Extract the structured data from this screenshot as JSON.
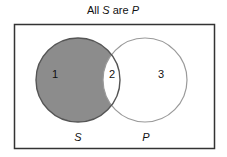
{
  "title": {
    "prefix": "All ",
    "term1": "S",
    "middle": " are ",
    "term2": "P"
  },
  "regions": [
    {
      "label": "1",
      "shaded": true
    },
    {
      "label": "2",
      "shaded": false
    },
    {
      "label": "3",
      "shaded": false
    }
  ],
  "circles": [
    {
      "label": "S"
    },
    {
      "label": "P"
    }
  ],
  "colors": {
    "shade": "#8c8c8c",
    "circle_s": "#555555",
    "circle_p": "#9a9a9a",
    "frame": "#333333"
  }
}
